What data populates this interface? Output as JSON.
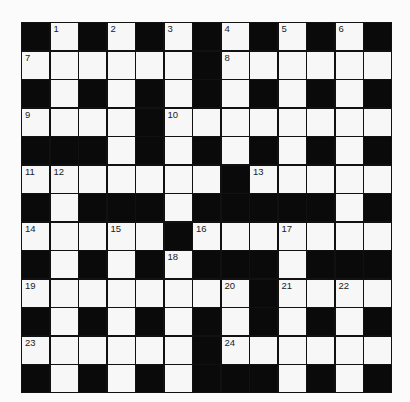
{
  "puzzle": {
    "rows": 13,
    "cols": 13,
    "colors": {
      "block": "#0a0a0a",
      "cell": "#f7f7f7",
      "background": "#fbfbfb"
    },
    "layout": [
      "#.#.#.#.#.#.#",
      "......#......",
      "#.#.#.#.#.#.#",
      "....#........",
      "###.#.#.#.#.#",
      ".......#.....",
      "#.###.#####.#",
      ".....#.......",
      "#.#.#.###.###",
      "........#....",
      "#.#.#.#.#.#.#",
      "......#......",
      "#.#.#.###.#.#"
    ],
    "numbers": [
      {
        "n": "1",
        "r": 0,
        "c": 1
      },
      {
        "n": "2",
        "r": 0,
        "c": 3
      },
      {
        "n": "3",
        "r": 0,
        "c": 5
      },
      {
        "n": "4",
        "r": 0,
        "c": 7
      },
      {
        "n": "5",
        "r": 0,
        "c": 9
      },
      {
        "n": "6",
        "r": 0,
        "c": 11
      },
      {
        "n": "7",
        "r": 1,
        "c": 0
      },
      {
        "n": "8",
        "r": 1,
        "c": 7
      },
      {
        "n": "9",
        "r": 3,
        "c": 0
      },
      {
        "n": "10",
        "r": 3,
        "c": 5
      },
      {
        "n": "11",
        "r": 5,
        "c": 0
      },
      {
        "n": "12",
        "r": 5,
        "c": 1
      },
      {
        "n": "13",
        "r": 5,
        "c": 8
      },
      {
        "n": "14",
        "r": 7,
        "c": 0
      },
      {
        "n": "15",
        "r": 7,
        "c": 3
      },
      {
        "n": "16",
        "r": 7,
        "c": 6
      },
      {
        "n": "17",
        "r": 7,
        "c": 9
      },
      {
        "n": "18",
        "r": 8,
        "c": 5
      },
      {
        "n": "19",
        "r": 9,
        "c": 0
      },
      {
        "n": "20",
        "r": 9,
        "c": 7
      },
      {
        "n": "21",
        "r": 9,
        "c": 9
      },
      {
        "n": "22",
        "r": 9,
        "c": 11
      },
      {
        "n": "23",
        "r": 11,
        "c": 0
      },
      {
        "n": "24",
        "r": 11,
        "c": 7
      }
    ]
  }
}
